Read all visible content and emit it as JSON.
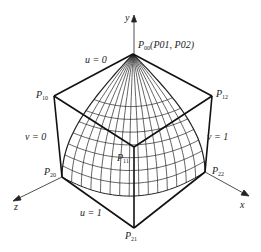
{
  "figure": {
    "axes": {
      "x": "x",
      "y": "y",
      "z": "z"
    },
    "points": {
      "P00": {
        "name": "P",
        "sub": "00",
        "extra": "(P01, P02)"
      },
      "P10": {
        "name": "P",
        "sub": "10"
      },
      "P12": {
        "name": "P",
        "sub": "12"
      },
      "P11": {
        "name": "P",
        "sub": "11"
      },
      "P20": {
        "name": "P",
        "sub": "20"
      },
      "P22": {
        "name": "P",
        "sub": "22"
      },
      "P21": {
        "name": "P",
        "sub": "21"
      }
    },
    "param_labels": {
      "u0": "u = 0",
      "u1": "u = 1",
      "v0": "v = 0",
      "v1": "v = 1"
    },
    "geometry": {
      "apex": [
        133,
        54
      ],
      "p10": [
        54,
        96
      ],
      "p12": [
        212,
        96
      ],
      "p11": [
        134,
        147
      ],
      "p20": [
        62,
        177
      ],
      "p22": [
        205,
        172
      ],
      "p21": [
        134,
        228
      ],
      "bottom_mid": [
        134,
        196
      ],
      "meridians": 15,
      "latitudes": 8,
      "line_color": "#222222"
    }
  }
}
